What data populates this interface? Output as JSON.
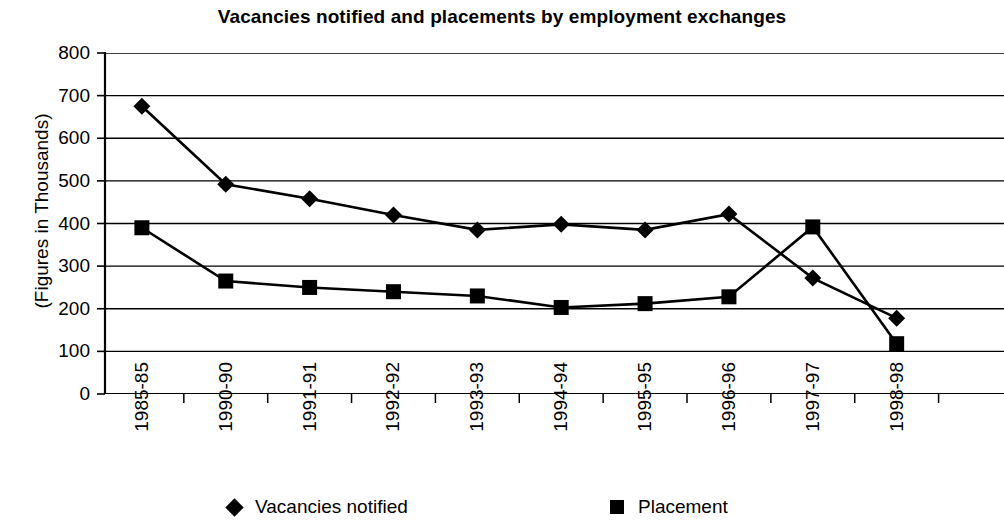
{
  "chart_data": {
    "type": "line",
    "title": "Vacancies notified and placements by employment exchanges",
    "xlabel": "",
    "ylabel": "(Figures in Thousands)",
    "ylim": [
      0,
      800
    ],
    "ytick_step": 100,
    "yticks": [
      "800",
      "700",
      "600",
      "500",
      "400",
      "300",
      "200",
      "100",
      "0"
    ],
    "grid": true,
    "legend_position": "bottom",
    "categories": [
      "1985-85",
      "1990-90",
      "1991-91",
      "1992-92",
      "1993-93",
      "1994-94",
      "1995-95",
      "1996-96",
      "1997-97",
      "1998-98"
    ],
    "series": [
      {
        "name": "Vacancies notified",
        "marker": "diamond",
        "color": "#000000",
        "values": [
          675,
          492,
          458,
          420,
          385,
          398,
          385,
          422,
          272,
          178
        ]
      },
      {
        "name": "Placement",
        "marker": "square",
        "color": "#000000",
        "values": [
          390,
          265,
          250,
          240,
          230,
          203,
          212,
          228,
          392,
          118
        ]
      }
    ]
  },
  "legend": {
    "entries": [
      {
        "label": "Vacancies notified",
        "marker": "diamond"
      },
      {
        "label": "Placement",
        "marker": "square"
      }
    ]
  },
  "colors": {
    "ink": "#000000",
    "grid": "#000000",
    "background": "#ffffff"
  }
}
